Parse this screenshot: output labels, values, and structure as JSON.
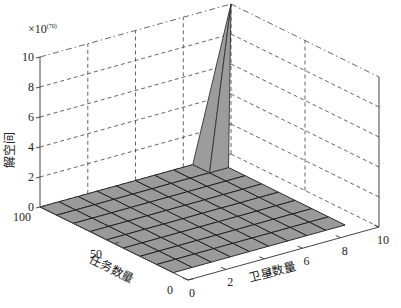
{
  "chart_data": {
    "type": "surface3d",
    "title": "",
    "exponent_label": "×10",
    "exponent_power": "(70)",
    "zlabel": "解空间",
    "xlabel": "卫星数量",
    "ylabel": "任务数量",
    "x_ticks": [
      "0",
      "2",
      "4",
      "6",
      "8",
      "10"
    ],
    "y_ticks": [
      "0",
      "50",
      "100"
    ],
    "z_ticks": [
      "0",
      "2",
      "4",
      "6",
      "8",
      "10"
    ],
    "xlim": [
      0,
      10
    ],
    "ylim": [
      0,
      100
    ],
    "zlim": [
      0,
      10
    ],
    "grid": true,
    "surface": {
      "x_range": [
        0,
        9
      ],
      "y_range": [
        10,
        100
      ],
      "x_cells": 9,
      "y_cells": 8,
      "baseline_value": 0,
      "peak": {
        "x": 9,
        "y": 100,
        "z": 10
      },
      "note": "Surface is ~0 everywhere except a sharp spike near max satellites and max tasks, reaching ~10×10^70"
    },
    "colors": {
      "surface": "#9a9a9a",
      "edges": "#1a1a1a",
      "grid": "#555555"
    }
  }
}
